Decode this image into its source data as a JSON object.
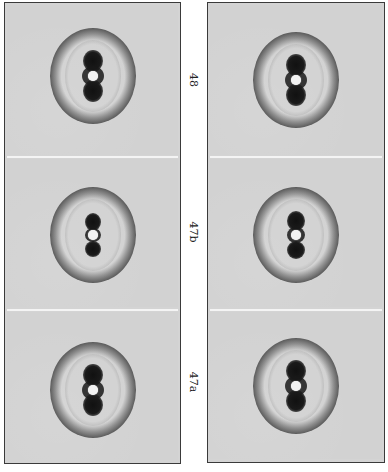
{
  "figure": {
    "type": "diffraction-pattern-grid",
    "rows": [
      {
        "label": "48",
        "position": "top"
      },
      {
        "label": "47b",
        "position": "middle"
      },
      {
        "label": "47a",
        "position": "bottom"
      }
    ],
    "columns": [
      "left",
      "right"
    ],
    "panel_count": 6,
    "colors": {
      "background": "#d2d2d2",
      "ring": "#3a3a3a",
      "lobes": "#111111",
      "beam_spot": "#f2f2f2",
      "border": "#3a3a3a"
    }
  }
}
